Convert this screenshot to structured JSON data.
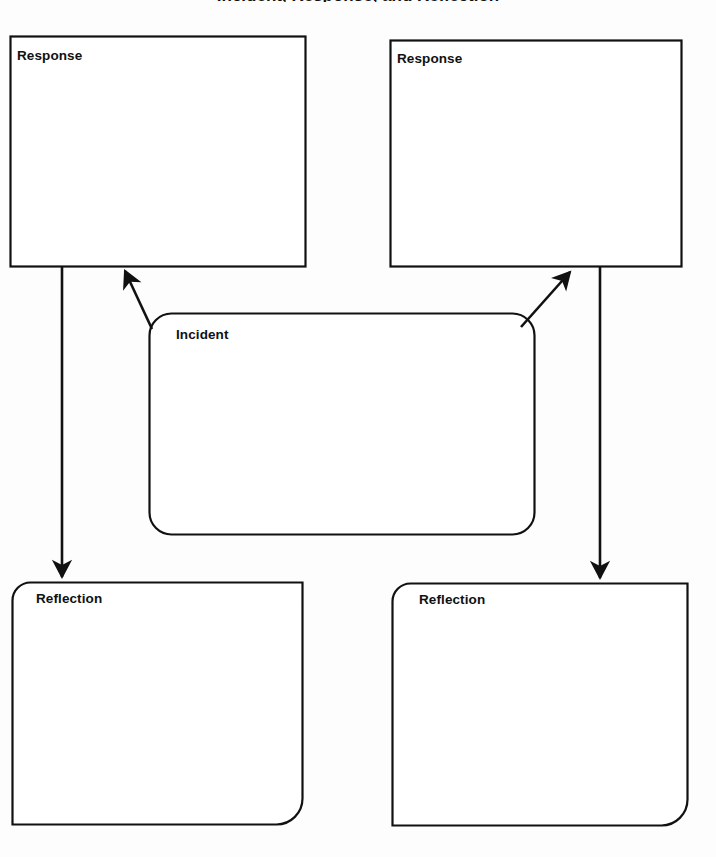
{
  "page": {
    "width": 716,
    "height": 857,
    "background_color": "#fdfdfd",
    "stroke_color": "#111111",
    "title_partial": "Incident, Response, and Reflection"
  },
  "boxes": {
    "response_left": {
      "label": "Response",
      "shape": "rectangle",
      "x": 10,
      "y": 36,
      "width": 296,
      "height": 231,
      "content": ""
    },
    "response_right": {
      "label": "Response",
      "shape": "rectangle",
      "x": 390,
      "y": 40,
      "width": 292,
      "height": 227,
      "content": ""
    },
    "incident": {
      "label": "Incident",
      "shape": "rounded-rectangle",
      "x": 149,
      "y": 313,
      "width": 386,
      "height": 222,
      "corner_radius": 22,
      "content": ""
    },
    "reflection_left": {
      "label": "Reflection",
      "shape": "rounded-corner-rectangle",
      "x": 12,
      "y": 582,
      "width": 291,
      "height": 243,
      "content": ""
    },
    "reflection_right": {
      "label": "Reflection",
      "shape": "rounded-corner-rectangle",
      "x": 392,
      "y": 583,
      "width": 296,
      "height": 242,
      "content": ""
    }
  },
  "connectors": [
    {
      "name": "incident-to-response-left",
      "from": "incident",
      "to": "response_left",
      "style": "diagonal-arrow",
      "direction": "up-left"
    },
    {
      "name": "response-left-to-reflection-left",
      "from": "response_left",
      "to": "reflection_left",
      "style": "vertical-arrow",
      "direction": "down"
    },
    {
      "name": "incident-to-response-right",
      "from": "incident",
      "to": "response_right",
      "style": "diagonal-arrow",
      "direction": "up-right"
    },
    {
      "name": "response-right-to-reflection-right",
      "from": "response_right",
      "to": "reflection_right",
      "style": "vertical-arrow",
      "direction": "down"
    }
  ]
}
